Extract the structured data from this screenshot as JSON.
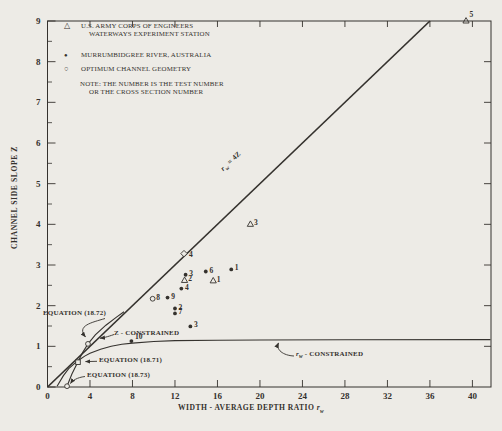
{
  "figure": {
    "background": "#edebe6",
    "ink": "#35322e"
  },
  "legend": {
    "items": [
      {
        "marker": "open-triangle-icon",
        "glyph": "△",
        "line1": "U.S. ARMY CORPS OF ENGINEERS",
        "line2": "WATERWAYS EXPERIMENT STATION"
      },
      {
        "marker": "filled-circle-icon",
        "glyph": "●",
        "line1": "MURRUMBIDGREE RIVER, AUSTRALIA",
        "line2": ""
      },
      {
        "marker": "open-circle-icon",
        "glyph": "○",
        "line1": "OPTIMUM CHANNEL GEOMETRY",
        "line2": ""
      }
    ],
    "note_line1": "NOTE: THE NUMBER IS THE TEST NUMBER",
    "note_line2": "OR THE CROSS SECTION NUMBER"
  },
  "axes": {
    "x_title_main": "WIDTH - AVERAGE DEPTH RATIO ",
    "x_title_symbol": "r",
    "x_title_sub": "w",
    "y_title": "CHANNEL SIDE SLOPE Z"
  },
  "annotations": {
    "eq72": "EQUATION (18.72)",
    "z_constrained": "Z - CONSTRAINED",
    "eq71": "EQUATION (18.71)",
    "eq73": "EQUATION (18.73)",
    "rw_symbol": "r",
    "rw_sub": "w",
    "rw_suffix": " - CONSTRAINED",
    "line_symbol": "r",
    "line_sub": "w",
    "line_suffix": " = 4Z"
  },
  "chart_data": {
    "type": "scatter",
    "title": "",
    "xlabel": "WIDTH - AVERAGE DEPTH RATIO r_w",
    "ylabel": "CHANNEL SIDE SLOPE Z",
    "xlim": [
      0,
      41.75
    ],
    "ylim": [
      0,
      9
    ],
    "x_ticks": [
      0,
      4,
      8,
      12,
      16,
      20,
      24,
      28,
      32,
      36,
      40
    ],
    "y_ticks": [
      0,
      1,
      2,
      3,
      4,
      5,
      6,
      7,
      8,
      9
    ],
    "y_minor_step": 0.5,
    "grid": false,
    "legend_position": "top-left-inside",
    "series": [
      {
        "name": "U.S. Army Corps of Engineers Waterways Experiment Station",
        "marker": "open-triangle",
        "points": [
          {
            "x": 15.6,
            "y": 2.61,
            "label": "1"
          },
          {
            "x": 12.9,
            "y": 2.62,
            "label": "2"
          },
          {
            "x": 19.1,
            "y": 4.0,
            "label": "3"
          },
          {
            "x": 39.4,
            "y": 9.0,
            "label": "5",
            "dx": 3.5,
            "dy": -4
          }
        ]
      },
      {
        "name": "Murrumbidgree River, Australia",
        "marker": "filled-circle",
        "points": [
          {
            "x": 17.3,
            "y": 2.89,
            "label": "1"
          },
          {
            "x": 12.0,
            "y": 1.93,
            "label": "2"
          },
          {
            "x": 13.0,
            "y": 2.76,
            "label": "3"
          },
          {
            "x": 13.45,
            "y": 1.49,
            "label": "3"
          },
          {
            "x": 12.6,
            "y": 2.42,
            "label": "4"
          },
          {
            "x": 14.9,
            "y": 2.84,
            "label": "6"
          },
          {
            "x": 12.0,
            "y": 1.81,
            "label": "7"
          },
          {
            "x": 11.3,
            "y": 2.2,
            "label": "9"
          },
          {
            "x": 7.9,
            "y": 1.13,
            "label": "10",
            "dy": -2.5
          }
        ]
      },
      {
        "name": "Optimum Channel Geometry",
        "marker": "open-circle",
        "points": [
          {
            "x": 9.9,
            "y": 2.17,
            "label": "8"
          }
        ]
      },
      {
        "name": "Point on optimum line",
        "marker": "open-diamond",
        "points": [
          {
            "x": 12.85,
            "y": 3.28,
            "label": "4",
            "dx": 5,
            "dy": 3
          }
        ]
      }
    ],
    "reference_line": {
      "label": "r_w = 4Z",
      "x1": 0,
      "y1": 0,
      "x2": 36,
      "y2": 9
    },
    "curves": [
      {
        "name": "z-constrained",
        "points": [
          [
            1.84,
            0.02
          ],
          [
            2.3,
            0.32
          ],
          [
            2.87,
            0.62
          ],
          [
            3.3,
            0.85
          ],
          [
            3.81,
            1.06
          ],
          [
            4.5,
            1.28
          ],
          [
            5.5,
            1.52
          ],
          [
            6.5,
            1.72
          ],
          [
            7.2,
            1.85
          ]
        ]
      },
      {
        "name": "rw-constrained",
        "points": [
          [
            0.9,
            0.02
          ],
          [
            1.5,
            0.28
          ],
          [
            2.0,
            0.45
          ],
          [
            2.5,
            0.57
          ],
          [
            3.0,
            0.67
          ],
          [
            3.5,
            0.76
          ],
          [
            4.0,
            0.83
          ],
          [
            5.0,
            0.93
          ],
          [
            6.0,
            1.0
          ],
          [
            7.0,
            1.05
          ],
          [
            8.0,
            1.08
          ],
          [
            10,
            1.12
          ],
          [
            12,
            1.14
          ],
          [
            16,
            1.15
          ],
          [
            20,
            1.155
          ],
          [
            28,
            1.16
          ],
          [
            41.7,
            1.165
          ]
        ]
      }
    ],
    "callout_markers": [
      {
        "marker": "open-circle",
        "x": 3.81,
        "y": 1.06,
        "refers_to": "EQUATION (18.72)"
      },
      {
        "marker": "open-square",
        "x": 2.87,
        "y": 0.61,
        "refers_to": "EQUATION (18.71)"
      },
      {
        "marker": "open-circle",
        "x": 1.84,
        "y": 0.02,
        "refers_to": "EQUATION (18.73)"
      }
    ]
  }
}
